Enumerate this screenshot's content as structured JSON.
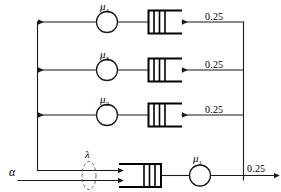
{
  "diagram": {
    "colors": {
      "line": "#1a1a1a",
      "thick_line": "#000000",
      "background": "#ffffff",
      "dashed": "#555555"
    },
    "inputs": {
      "alpha_label": "α",
      "lambda_label": "λ"
    },
    "output": {
      "rate_label": "0.25"
    },
    "servers": [
      {
        "id": "mu1",
        "label": "μ",
        "subscript": "1",
        "name": "server-mu-1"
      },
      {
        "id": "mu2",
        "label": "μ",
        "subscript": "2",
        "name": "server-mu-2"
      },
      {
        "id": "mu3",
        "label": "μ",
        "subscript": "3",
        "name": "server-mu-3"
      },
      {
        "id": "mu4",
        "label": "μ",
        "subscript": "4",
        "name": "server-mu-4"
      }
    ],
    "branch_rates": [
      {
        "row": "top",
        "value": "0.25"
      },
      {
        "row": "middle",
        "value": "0.25"
      },
      {
        "row": "lower",
        "value": "0.25"
      }
    ],
    "queues": [
      {
        "id": "q4",
        "orientation": "opens-right",
        "bars": 3
      },
      {
        "id": "q3",
        "orientation": "opens-right",
        "bars": 3
      },
      {
        "id": "q2",
        "orientation": "opens-right",
        "bars": 3
      },
      {
        "id": "q1",
        "orientation": "opens-left",
        "bars": 3
      }
    ]
  }
}
